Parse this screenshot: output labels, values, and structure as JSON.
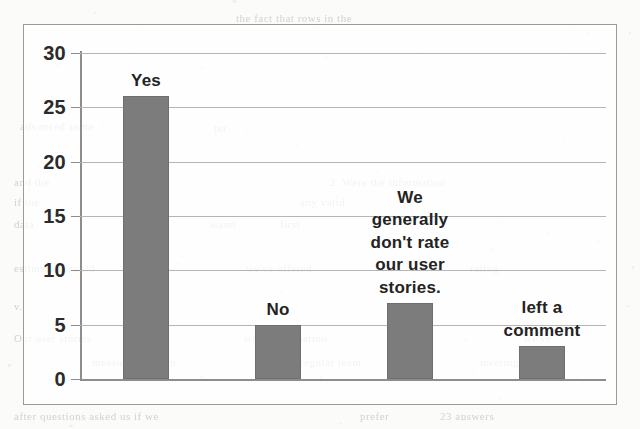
{
  "chart_data": {
    "type": "bar",
    "title": "",
    "subtitle": "",
    "xlabel": "",
    "ylabel": "",
    "ylim": [
      0,
      30
    ],
    "ytick_step": 5,
    "yticks": [
      "0",
      "5",
      "10",
      "15",
      "20",
      "25",
      "30"
    ],
    "grid": true,
    "legend": "none",
    "categories": [
      "Yes",
      "No",
      "We\ngenerally\ndon't rate\nour user\nstories.",
      "left a\ncomment"
    ],
    "values": [
      26,
      5,
      7,
      3
    ],
    "bar_color": "#7c7c7c",
    "grid_color": "#b5b5b3",
    "axis_color": "#8d8d8b",
    "text_color": "#232323",
    "background_color": "#fbfbfa"
  },
  "background_bleed": {
    "lines": [
      {
        "text": "the fact that rows in the",
        "x": 236,
        "y": 12,
        "size": 11
      },
      {
        "text": "advanced some",
        "x": 20,
        "y": 120,
        "size": 11
      },
      {
        "text": "ter",
        "x": 214,
        "y": 122,
        "size": 11
      },
      {
        "text": "and the",
        "x": 14,
        "y": 176,
        "size": 11
      },
      {
        "text": "2. Were the information",
        "x": 330,
        "y": 176,
        "size": 11
      },
      {
        "text": "if the",
        "x": 14,
        "y": 196,
        "size": 11
      },
      {
        "text": "any valid",
        "x": 300,
        "y": 196,
        "size": 11
      },
      {
        "text": "data",
        "x": 14,
        "y": 218,
        "size": 11
      },
      {
        "text": "stand",
        "x": 210,
        "y": 218,
        "size": 11
      },
      {
        "text": "first",
        "x": 280,
        "y": 218,
        "size": 11
      },
      {
        "text": "estimation could",
        "x": 14,
        "y": 262,
        "size": 11
      },
      {
        "text": "we've offered",
        "x": 246,
        "y": 262,
        "size": 11
      },
      {
        "text": "rating",
        "x": 470,
        "y": 262,
        "size": 11
      },
      {
        "text": "v.",
        "x": 14,
        "y": 300,
        "size": 11
      },
      {
        "text": "Our user stories",
        "x": 14,
        "y": 332,
        "size": 11
      },
      {
        "text": "which estimation",
        "x": 244,
        "y": 332,
        "size": 11
      },
      {
        "text": "we've",
        "x": 524,
        "y": 332,
        "size": 11
      },
      {
        "text": "measurements on",
        "x": 92,
        "y": 356,
        "size": 11
      },
      {
        "text": "regular team",
        "x": 300,
        "y": 356,
        "size": 11
      },
      {
        "text": "meetings",
        "x": 480,
        "y": 356,
        "size": 11
      },
      {
        "text": "after questions asked us if we",
        "x": 14,
        "y": 410,
        "size": 11
      },
      {
        "text": "prefer",
        "x": 360,
        "y": 410,
        "size": 11
      },
      {
        "text": "23 answers",
        "x": 440,
        "y": 410,
        "size": 11
      }
    ]
  }
}
